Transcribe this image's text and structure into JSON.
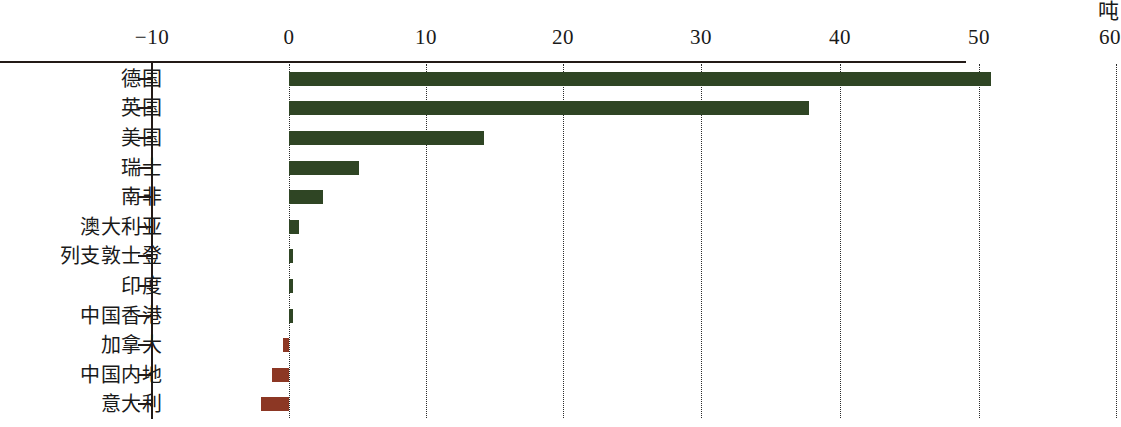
{
  "chart_data": {
    "type": "bar",
    "orientation": "horizontal",
    "title": "",
    "subtitle": "",
    "unit_label": "吨",
    "xlabel": "",
    "ylabel": "",
    "xlim": [
      -10,
      60
    ],
    "xticks": [
      -10,
      0,
      10,
      20,
      30,
      40,
      50,
      60
    ],
    "xtick_labels": [
      "−10",
      "0",
      "10",
      "20",
      "30",
      "40",
      "50",
      "60"
    ],
    "grid": "vertical-dotted",
    "legend": "none",
    "categories": [
      "德国",
      "英国",
      "美国",
      "瑞士",
      "南非",
      "澳大利亚",
      "列支敦士登",
      "印度",
      "中国香港",
      "加拿大",
      "中国内地",
      "意大利"
    ],
    "values": [
      51.0,
      37.8,
      14.2,
      5.1,
      2.5,
      0.7,
      0.3,
      0.3,
      0.3,
      -0.4,
      -1.2,
      -2.0
    ],
    "colors": {
      "positive": "#2f4524",
      "negative": "#8c3724",
      "axis": "#231a17",
      "gridline": "#2b2b2b",
      "background": "#ffffff"
    }
  }
}
